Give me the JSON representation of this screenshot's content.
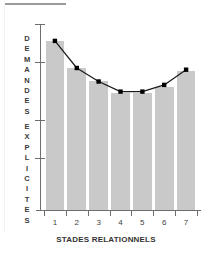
{
  "figure": {
    "background_color": "#ffffff",
    "bar_color": "#c9c9c9",
    "line_color": "#1a1a1a",
    "marker_color": "#000000",
    "axis_color": "#6e6e6e",
    "text_color": "#333333"
  },
  "ylabel_letters_top": [
    "D",
    "E",
    "M",
    "A",
    "N",
    "D",
    "E",
    "S"
  ],
  "ylabel_letters_bottom": [
    "E",
    "X",
    "P",
    "L",
    "I",
    "C",
    "I",
    "T",
    "E",
    "S"
  ],
  "chart_data": {
    "type": "bar",
    "title": "",
    "subtitle": "",
    "xlabel": "STADES RELATIONNELS",
    "ylabel": "DEMANDES EXPLICITES",
    "categories": [
      "1",
      "2",
      "3",
      "4",
      "5",
      "6",
      "7"
    ],
    "series": [
      {
        "name": "Demandes explicites (barres)",
        "type": "bar",
        "values": [
          100,
          84,
          76,
          69,
          69,
          73,
          82
        ]
      },
      {
        "name": "Demandes explicites (courbe)",
        "type": "line",
        "values": [
          100,
          84,
          76,
          70,
          70,
          74,
          83
        ]
      }
    ],
    "ylim": [
      0,
      110
    ],
    "xlim": [
      0.5,
      7.5
    ],
    "y_tick_labels": [
      "",
      "",
      "",
      ""
    ],
    "y_tick_values": [
      100,
      69,
      38,
      108
    ],
    "grid": false,
    "legend": false,
    "legend_position": "none",
    "annotations": []
  },
  "axis": {
    "y_ticks_count": 4,
    "x_ticks_count": 7
  }
}
